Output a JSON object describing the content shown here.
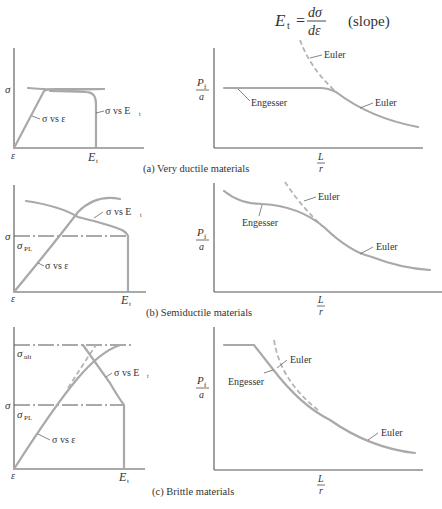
{
  "header": {
    "formula_lhs": "E",
    "formula_lhs_sub": "t",
    "formula_eq": "=",
    "formula_num": "dσ",
    "formula_den": "dε",
    "formula_note": "(slope)"
  },
  "panels": [
    {
      "caption": "(a) Very ductile materials",
      "left": {
        "y_label": "σ",
        "origin_label": "ε",
        "x_label": "E",
        "x_label_sub": "t",
        "curve_labels": [
          "σ vs ε",
          "σ vs E"
        ],
        "curve_label_sub": "t"
      },
      "right": {
        "y_label_num": "P",
        "y_label_num_sub": "f",
        "y_label_den": "a",
        "x_label_num": "L",
        "x_label_den": "r",
        "labels": [
          "Engesser",
          "Euler",
          "Euler"
        ]
      }
    },
    {
      "caption": "(b) Semiductile materials",
      "left": {
        "y_label": "σ",
        "y_label2": "σ",
        "y_label2_sub": "PL",
        "origin_label": "ε",
        "x_label": "E",
        "x_label_sub": "t",
        "curve_labels": [
          "σ vs ε",
          "σ vs E"
        ],
        "curve_label_sub": "t"
      },
      "right": {
        "y_label_num": "P",
        "y_label_num_sub": "f",
        "y_label_den": "a",
        "x_label_num": "L",
        "x_label_den": "r",
        "labels": [
          "Engesser",
          "Euler",
          "Euler"
        ]
      }
    },
    {
      "caption": "(c) Brittle materials",
      "left": {
        "y_label": "σ",
        "y_label2": "σ",
        "y_label2_sub": "PL",
        "y_label3": "σ",
        "y_label3_sub": "ult",
        "origin_label": "ε",
        "x_label": "E",
        "x_label_sub": "t",
        "curve_labels": [
          "σ vs ε",
          "σ vs E"
        ],
        "curve_label_sub": "t"
      },
      "right": {
        "y_label_num": "P",
        "y_label_num_sub": "f",
        "y_label_den": "a",
        "x_label_num": "L",
        "x_label_den": "r",
        "labels": [
          "Engesser",
          "Euler",
          "Euler"
        ]
      }
    }
  ],
  "colors": {
    "curve": "#a9a9a9",
    "axis": "#555555",
    "text": "#333333",
    "background": "#ffffff"
  }
}
